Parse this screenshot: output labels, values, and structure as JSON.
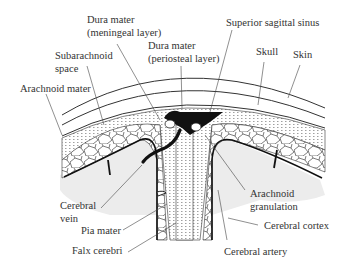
{
  "diagram": {
    "labels": {
      "dura_meningeal_1": "Dura mater",
      "dura_meningeal_2": "(meningeal layer)",
      "dura_periosteal_1": "Dura mater",
      "dura_periosteal_2": "(periosteal layer)",
      "superior_sagittal_sinus": "Superior sagittal sinus",
      "skull": "Skull",
      "skin": "Skin",
      "subarachnoid_1": "Subarachnoid",
      "subarachnoid_2": "space",
      "arachnoid_mater": "Arachnoid mater",
      "cerebral_vein_1": "Cerebral",
      "cerebral_vein_2": "vein",
      "pia_mater": "Pia mater",
      "falx_cerebri": "Falx cerebri",
      "arachnoid_granulation_1": "Arachnoid",
      "arachnoid_granulation_2": "granulation",
      "cerebral_cortex": "Cerebral cortex",
      "cerebral_artery": "Cerebral artery"
    },
    "colors": {
      "line": "#222222",
      "sinus": "#111111",
      "cortex": "#eeeeee",
      "dots": "#777777"
    }
  }
}
